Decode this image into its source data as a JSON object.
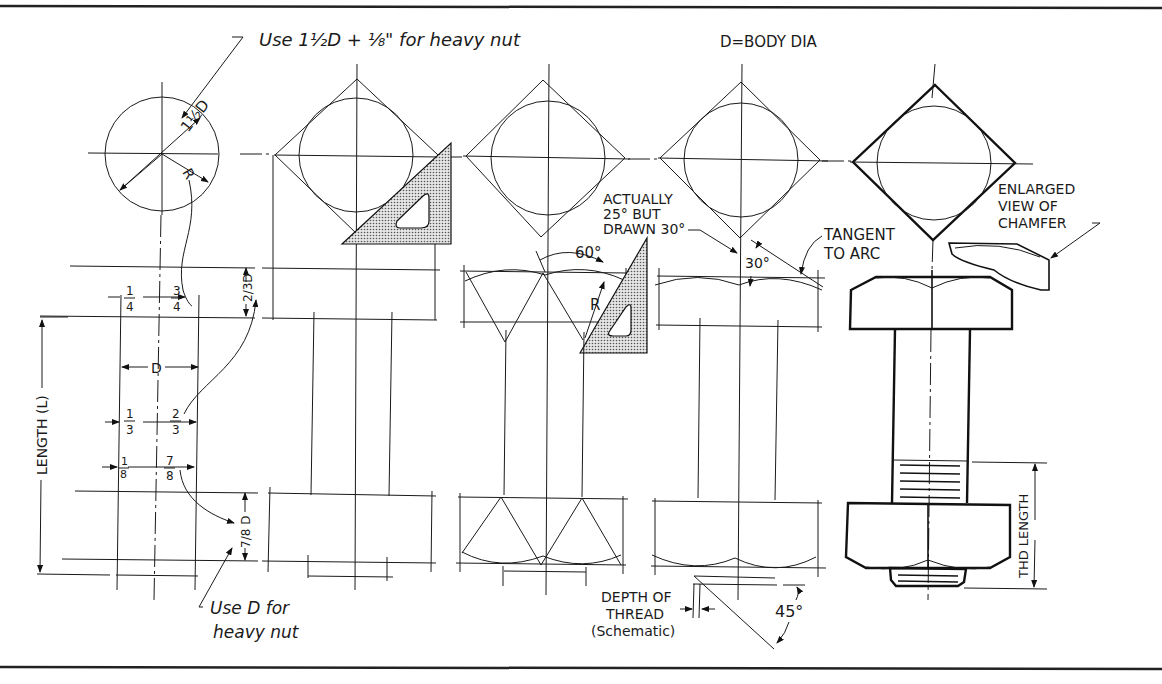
{
  "figure": {
    "notes": {
      "heavy_nut_top": "Use 1½D + ⅛\" for heavy nut",
      "heavy_nut_top_parts": [
        "Use 1",
        "1",
        "2",
        "D+",
        "1",
        "8",
        "\" for heavy nut"
      ],
      "heavy_nut_bottom_line1": "Use D for",
      "heavy_nut_bottom_line2": "heavy nut",
      "body_dia": "D=BODY DIA",
      "actually_line1": "ACTUALLY",
      "actually_line2": "25° BUT",
      "actually_line3": "DRAWN 30°",
      "tangent_line1": "TANGENT",
      "tangent_line2": "TO ARC",
      "enlarged_line1": "ENLARGED",
      "enlarged_line2": "VIEW OF",
      "enlarged_line3": "CHAMFER",
      "depth_line1": "DEPTH OF",
      "depth_line2": "THREAD",
      "depth_line3": "(Schematic)"
    },
    "dimensions": {
      "one_half_D": "1½D",
      "R": "R",
      "quarter": [
        "1",
        "4"
      ],
      "three_quarter": [
        "3",
        "4"
      ],
      "two_thirds_D": [
        "2",
        "3",
        "D"
      ],
      "D": "D",
      "third": [
        "1",
        "3"
      ],
      "two_third": [
        "2",
        "3"
      ],
      "eighth": [
        "1",
        "8"
      ],
      "seven_eighth": [
        "7",
        "8"
      ],
      "seven_eighths_D": [
        "7",
        "8",
        "D"
      ],
      "length": "LENGTH (L)",
      "angle_60": "60°",
      "angle_30": "30°",
      "angle_45": "45°",
      "thread_length": "THD LENGTH"
    },
    "colors": {
      "ink": "#1a1a1a",
      "paper": "#ffffff",
      "triangle_fill": "#bdbdbd"
    }
  }
}
